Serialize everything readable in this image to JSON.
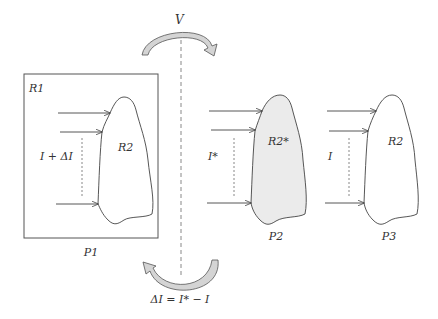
{
  "figure": {
    "top_transition_label": "V",
    "bottom_transition_label": "ΔI = I* − I",
    "colors": {
      "stroke": "#444444",
      "shaded_fill": "#ebebeb",
      "arrow_fill": "#d4d4d4",
      "dashed_line": "#888888",
      "background": "#ffffff"
    },
    "panels": [
      {
        "id": "P1",
        "label": "P1",
        "outer_region_label": "R1",
        "shape_label": "R2",
        "current_label": "I + ΔI",
        "shaded": false,
        "boxed": true
      },
      {
        "id": "P2",
        "label": "P2",
        "shape_label": "R2*",
        "current_label": "I*",
        "shaded": true,
        "boxed": false
      },
      {
        "id": "P3",
        "label": "P3",
        "shape_label": "R2",
        "current_label": "I",
        "shaded": false,
        "boxed": false
      }
    ]
  }
}
